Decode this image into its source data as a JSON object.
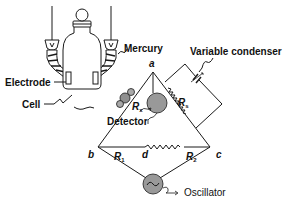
{
  "diagram": {
    "type": "Wheatstone bridge conductance measurement circuit",
    "labels": {
      "mercury": "Mercury",
      "variable_condenser": "Variable condenser",
      "electrode": "Electrode",
      "cell": "Cell",
      "detector": "Detector",
      "oscillator": "Oscillator"
    },
    "nodes": {
      "a": "a",
      "b": "b",
      "c": "c",
      "d": "d"
    },
    "resistors": {
      "rx": {
        "base": "R",
        "sub": "x"
      },
      "rs": {
        "base": "R",
        "sub": "s"
      },
      "r1": {
        "base": "R",
        "sub": "1"
      },
      "r2": {
        "base": "R",
        "sub": "2"
      }
    },
    "colors": {
      "line": "#1a1a1a",
      "component_fill": "#9a9a9a",
      "background": "#ffffff"
    }
  }
}
